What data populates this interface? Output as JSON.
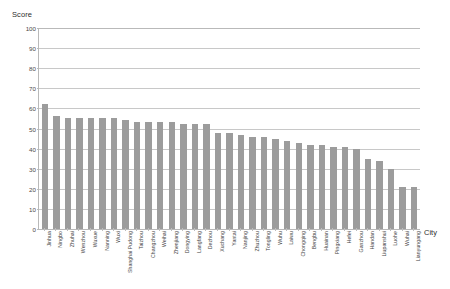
{
  "chart_data": {
    "type": "bar",
    "title": "",
    "ylabel": "Score",
    "xlabel": "City",
    "ylim": [
      0,
      100
    ],
    "yticks": [
      0,
      10,
      20,
      30,
      40,
      50,
      60,
      70,
      80,
      90,
      100
    ],
    "grid": true,
    "legend": false,
    "bar_color": "#9c9c9c",
    "categories": [
      "Jinhua",
      "Ningbo",
      "Zhuhai",
      "Wenzhou",
      "Wuxue",
      "Nanning",
      "Wuxi",
      "Shanghai Pudong",
      "Taizhou",
      "Changzhou",
      "Weihai",
      "Zhenjiang",
      "Dongying",
      "Langfang",
      "Dezhou",
      "Xuchang",
      "Yantai",
      "Nanjing",
      "Zhuzhou",
      "Tongling",
      "Wuhu",
      "Laiwu",
      "Chongqing",
      "Bengbu",
      "Huainan",
      "Pingxiang",
      "Hefei",
      "Ganzhou",
      "Handan",
      "Liupanshui",
      "Luohe",
      "Wuhai",
      "Lianyungang"
    ],
    "values": [
      62,
      56,
      55,
      55,
      55,
      55,
      55,
      54,
      53,
      53,
      53,
      53,
      52,
      52,
      52,
      48,
      48,
      47,
      46,
      46,
      45,
      44,
      43,
      42,
      42,
      41,
      41,
      40,
      35,
      34,
      30,
      21,
      21
    ]
  },
  "axes": {
    "y_title": "Score",
    "x_title": "City"
  }
}
